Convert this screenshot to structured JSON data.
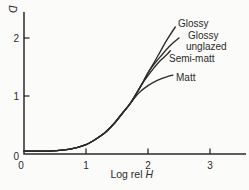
{
  "figure": {
    "background": "#fbfbf9",
    "ink_color": "#2b2b2b"
  },
  "chart_data": {
    "type": "line",
    "title": "",
    "xlabel": "Log rel H",
    "xlabel_prefix": "Log rel",
    "xlabel_symbol": "H",
    "ylabel": "D",
    "xlim": [
      0,
      3.55
    ],
    "ylim": [
      0,
      2.45
    ],
    "x_ticks": [
      0,
      1,
      2,
      3
    ],
    "y_ticks": [
      0,
      1,
      2
    ],
    "grid": false,
    "legend": "inline-curve-labels",
    "series": [
      {
        "name": "Glossy",
        "label_lines": [
          "Glossy"
        ],
        "points": [
          [
            0,
            0.05
          ],
          [
            0.4,
            0.05
          ],
          [
            0.65,
            0.07
          ],
          [
            0.85,
            0.11
          ],
          [
            1.0,
            0.16
          ],
          [
            1.15,
            0.25
          ],
          [
            1.3,
            0.36
          ],
          [
            1.45,
            0.52
          ],
          [
            1.6,
            0.72
          ],
          [
            1.7,
            0.85
          ],
          [
            1.8,
            1.02
          ],
          [
            1.9,
            1.2
          ],
          [
            2.0,
            1.4
          ],
          [
            2.1,
            1.58
          ],
          [
            2.2,
            1.77
          ],
          [
            2.3,
            1.96
          ],
          [
            2.44,
            2.19
          ]
        ]
      },
      {
        "name": "Glossy unglazed",
        "label_lines": [
          "Glossy",
          "unglazed"
        ],
        "points": [
          [
            0,
            0.05
          ],
          [
            0.4,
            0.05
          ],
          [
            0.65,
            0.07
          ],
          [
            0.85,
            0.11
          ],
          [
            1.0,
            0.16
          ],
          [
            1.15,
            0.25
          ],
          [
            1.3,
            0.36
          ],
          [
            1.45,
            0.52
          ],
          [
            1.6,
            0.72
          ],
          [
            1.7,
            0.85
          ],
          [
            1.8,
            1.02
          ],
          [
            1.9,
            1.2
          ],
          [
            2.0,
            1.4
          ],
          [
            2.1,
            1.55
          ],
          [
            2.2,
            1.68
          ],
          [
            2.35,
            1.86
          ],
          [
            2.5,
            2.0
          ]
        ]
      },
      {
        "name": "Semi-matt",
        "label_lines": [
          "Semi-matt"
        ],
        "points": [
          [
            0,
            0.05
          ],
          [
            0.4,
            0.05
          ],
          [
            0.65,
            0.07
          ],
          [
            0.85,
            0.11
          ],
          [
            1.0,
            0.16
          ],
          [
            1.15,
            0.25
          ],
          [
            1.3,
            0.36
          ],
          [
            1.45,
            0.52
          ],
          [
            1.6,
            0.72
          ],
          [
            1.7,
            0.85
          ],
          [
            1.8,
            1.02
          ],
          [
            1.9,
            1.2
          ],
          [
            2.0,
            1.35
          ],
          [
            2.1,
            1.49
          ],
          [
            2.2,
            1.61
          ],
          [
            2.3,
            1.71
          ],
          [
            2.36,
            1.78
          ]
        ]
      },
      {
        "name": "Matt",
        "label_lines": [
          "Matt"
        ],
        "points": [
          [
            0,
            0.05
          ],
          [
            0.4,
            0.05
          ],
          [
            0.65,
            0.07
          ],
          [
            0.85,
            0.11
          ],
          [
            1.0,
            0.16
          ],
          [
            1.15,
            0.25
          ],
          [
            1.3,
            0.36
          ],
          [
            1.45,
            0.52
          ],
          [
            1.6,
            0.72
          ],
          [
            1.7,
            0.85
          ],
          [
            1.85,
            1.05
          ],
          [
            2.0,
            1.18
          ],
          [
            2.15,
            1.27
          ],
          [
            2.3,
            1.33
          ],
          [
            2.4,
            1.36
          ]
        ]
      }
    ]
  }
}
